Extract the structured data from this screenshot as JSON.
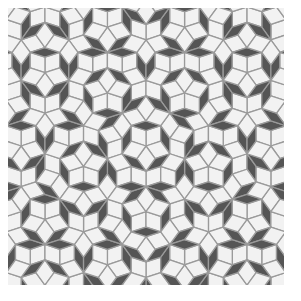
{
  "image": {
    "subject": "Penrose rhombus tiling (P3)",
    "background": "#ffffff"
  },
  "tiling": {
    "type": "penrose-p3",
    "frame": {
      "x": 8,
      "y": 8,
      "width": 276,
      "height": 277
    },
    "edge_length": 15.5,
    "center": [
      138,
      138
    ],
    "rotation_deg": 90,
    "colors": {
      "thick_rhombus": "#f2f2f2",
      "thin_rhombus": "#555555",
      "edge": "#9a9a9a"
    },
    "edge_width": 1.3,
    "grid_range": 12,
    "offsets": [
      0.2,
      0.2,
      0.2,
      0.2,
      0.2
    ]
  }
}
